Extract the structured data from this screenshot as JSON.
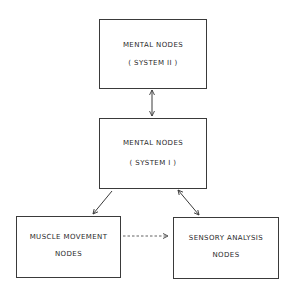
{
  "diagram": {
    "nodes": [
      {
        "id": "system2",
        "line1": "MENTAL  NODES",
        "line2": "( SYSTEM  II )"
      },
      {
        "id": "system1",
        "line1": "MENTAL  NODES",
        "line2": "( SYSTEM  I )"
      },
      {
        "id": "muscle",
        "line1": "MUSCLE  MOVEMENT",
        "line2": "NODES"
      },
      {
        "id": "sensory",
        "line1": "SENSORY  ANALYSIS",
        "line2": "NODES"
      }
    ],
    "edges": [
      {
        "from": "system2",
        "to": "system1",
        "style": "solid",
        "direction": "bidirectional"
      },
      {
        "from": "system1",
        "to": "muscle",
        "style": "solid",
        "direction": "forward"
      },
      {
        "from": "system1",
        "to": "sensory",
        "style": "solid",
        "direction": "bidirectional"
      },
      {
        "from": "muscle",
        "to": "sensory",
        "style": "dashed",
        "direction": "forward"
      }
    ],
    "colors": {
      "line": "#3a3a3a",
      "text": "#2a2a2a",
      "background": "#ffffff"
    }
  }
}
